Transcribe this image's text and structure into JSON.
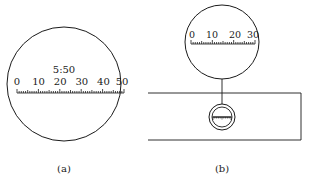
{
  "figure_a": {
    "ratio_label": "5:50",
    "scale_labels": [
      "0",
      "10",
      "20",
      "30",
      "40",
      "50"
    ],
    "caption": "(a)"
  },
  "figure_b": {
    "scale_labels": [
      "0",
      "10",
      "20",
      "30"
    ],
    "caption": "(b)"
  },
  "colors": {
    "line": "#1a1a1a",
    "background": "#ffffff"
  }
}
